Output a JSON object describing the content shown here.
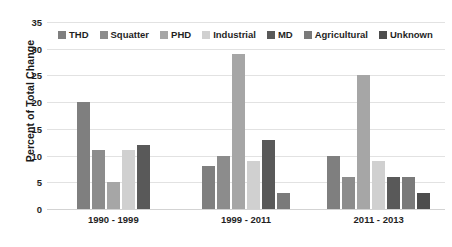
{
  "chart_data": {
    "type": "bar",
    "title": "",
    "xlabel": "",
    "ylabel": "Percent of Total Change",
    "ylim": [
      0,
      35
    ],
    "yticks": [
      0,
      5,
      10,
      15,
      20,
      25,
      30,
      35
    ],
    "grid": true,
    "legend_position": "top-inside",
    "categories": [
      "1990 - 1999",
      "1999 - 2011",
      "2011 - 2013"
    ],
    "series": [
      {
        "name": "THD",
        "color": "#7f7f7f",
        "values": [
          20,
          8,
          10
        ]
      },
      {
        "name": "Squatter",
        "color": "#8c8c8c",
        "values": [
          11,
          10,
          6
        ]
      },
      {
        "name": "PHD",
        "color": "#a6a6a6",
        "values": [
          5,
          29,
          25
        ]
      },
      {
        "name": "Industrial",
        "color": "#d0d0d0",
        "values": [
          11,
          9,
          9
        ]
      },
      {
        "name": "MD",
        "color": "#595959",
        "values": [
          12,
          13,
          6
        ]
      },
      {
        "name": "Agricultural",
        "color": "#7a7a7a",
        "values": [
          null,
          3,
          6
        ]
      },
      {
        "name": "Unknown",
        "color": "#4d4d4d",
        "values": [
          null,
          null,
          3
        ]
      }
    ]
  },
  "axis": {
    "y_title": "Percent of Total Change",
    "tick_labels": [
      "35",
      "30",
      "25",
      "20",
      "15",
      "10",
      "5",
      "0"
    ]
  },
  "legend": {
    "items": [
      {
        "label": "THD"
      },
      {
        "label": "Squatter"
      },
      {
        "label": "PHD"
      },
      {
        "label": "Industrial"
      },
      {
        "label": "MD"
      },
      {
        "label": "Agricultural"
      },
      {
        "label": "Unknown"
      }
    ]
  }
}
